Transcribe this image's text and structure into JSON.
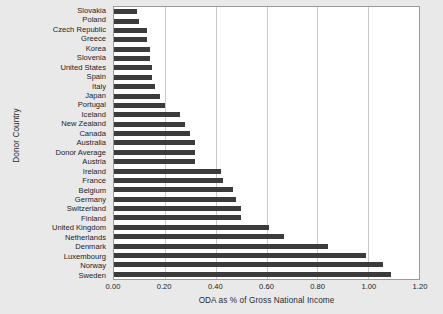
{
  "chart_data": {
    "type": "bar",
    "orientation": "horizontal",
    "title": "",
    "xlabel": "ODA as % of Gross National Income",
    "ylabel": "Donor Country",
    "xlim": [
      0.0,
      1.2
    ],
    "xticks": [
      "0.00",
      "0.20",
      "0.40",
      "0.60",
      "0.80",
      "1.00",
      "1.20"
    ],
    "xtick_values": [
      0.0,
      0.2,
      0.4,
      0.6,
      0.8,
      1.0,
      1.2
    ],
    "grid": "vertical",
    "legend": "none",
    "bar_color": "#3b3b3b",
    "plot_background": "#ffffff",
    "figure_background": "#e9e9e9",
    "grid_color": "#c9c9c9",
    "axis_color": "#9a9a9a",
    "categories": [
      "Slovakia",
      "Poland",
      "Czech Republic",
      "Greece",
      "Korea",
      "Slovenia",
      "United States",
      "Spain",
      "Italy",
      "Japan",
      "Portugal",
      "Iceland",
      "New Zealand",
      "Canada",
      "Australia",
      "Donor Average",
      "Austria",
      "Ireland",
      "France",
      "Belgium",
      "Germany",
      "Switzerland",
      "Finland",
      "United Kingdom",
      "Netherlands",
      "Denmark",
      "Luxembourg",
      "Norway",
      "Sweden"
    ],
    "values": [
      0.09,
      0.1,
      0.13,
      0.13,
      0.14,
      0.14,
      0.15,
      0.15,
      0.16,
      0.18,
      0.2,
      0.26,
      0.28,
      0.3,
      0.32,
      0.32,
      0.32,
      0.42,
      0.43,
      0.47,
      0.48,
      0.5,
      0.5,
      0.61,
      0.67,
      0.84,
      0.99,
      1.06,
      1.09
    ]
  }
}
